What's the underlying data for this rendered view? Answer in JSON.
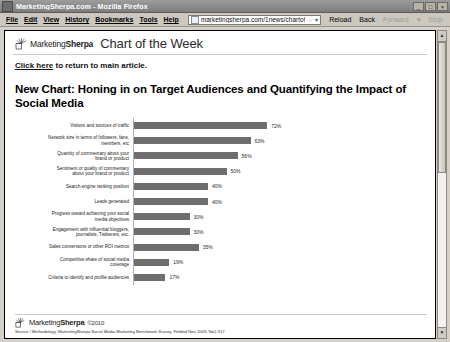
{
  "window": {
    "title": "MarketingSherpa.com - Mozilla Firefox",
    "icon": "firefox-icon",
    "minimize_label": "_",
    "maximize_label": "□",
    "close_label": "×"
  },
  "menubar": {
    "items": [
      {
        "label": "File",
        "accel": "F"
      },
      {
        "label": "Edit",
        "accel": "E"
      },
      {
        "label": "View",
        "accel": "V"
      },
      {
        "label": "History",
        "accel": "s"
      },
      {
        "label": "Bookmarks",
        "accel": "B"
      },
      {
        "label": "Tools",
        "accel": "T"
      },
      {
        "label": "Help",
        "accel": "H"
      }
    ]
  },
  "urlbar": {
    "value": "marketingsherpa.com/1news/chartofweek-02-23-10-lg.htm",
    "placeholder": "Search or enter address",
    "favicon": "site-favicon",
    "star_glyph": "☆",
    "dropdown_glyph": "▾"
  },
  "toolbar": {
    "reload_label": "Reload",
    "back_label": "Back",
    "forward_label": "Forward",
    "forward_caret": "▾",
    "stop_label": "Stop"
  },
  "scrollbar": {
    "up_glyph": "▲",
    "down_glyph": "▼"
  },
  "page": {
    "logo_text_light": "Marketing",
    "logo_text_bold": "Sherpa",
    "header_title": "Chart of the Week",
    "link_text": "Click here",
    "link_rest": " to return to main article.",
    "chart_title": "New Chart: Honing in on Target Audiences and Quantifying the Impact of Social Media",
    "footer_cc": "©2010",
    "source": "Source / Methodology: MarketingSherpa Social Media Marketing Benchmark Survey. Fielded Nov 2009, N=2,317"
  },
  "chart_data": {
    "type": "bar",
    "orientation": "horizontal",
    "title": "New Chart: Honing in on Target Audiences and Quantifying the Impact of Social Media",
    "xlabel": "",
    "ylabel": "",
    "xlim": [
      0,
      100
    ],
    "grid": false,
    "legend": false,
    "value_suffix": "%",
    "bar_color": "#6e6e6e",
    "categories": [
      "Visitors and sources of traffic",
      "Network size in terms of followers, fans,\nmembers, etc",
      "Quantity of commentary about your\nbrand or product",
      "Sentiment or quality of commentary\nabout your brand or product",
      "Search engine ranking position",
      "Leads generated",
      "Progress toward achieving your social\nmedia objectives",
      "Engagement with influential bloggers,\njournalists, Twitterers, etc.",
      "Sales conversions or other ROI metrics",
      "Competitive share of social media\ncoverage",
      "Criteria to identify and profile audiences"
    ],
    "values": [
      72,
      63,
      56,
      50,
      40,
      40,
      30,
      30,
      35,
      19,
      17
    ],
    "labels": [
      "72%",
      "63%",
      "56%",
      "50%",
      "40%",
      "40%",
      "30%",
      "30%",
      "35%",
      "19%",
      "17%"
    ]
  }
}
